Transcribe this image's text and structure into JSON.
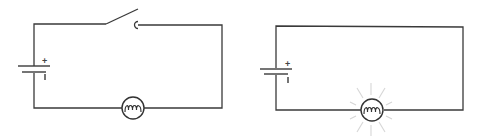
{
  "diagram": {
    "type": "circuit-comparison",
    "colors": {
      "wire": "#3a3a3a",
      "glow": "#d6d6d6",
      "background": "#ffffff"
    },
    "circuits": [
      {
        "name": "open-circuit",
        "switch_state": "open",
        "bulb_state": "off",
        "battery": {
          "positive_label": "+",
          "negative_label": "ı"
        }
      },
      {
        "name": "closed-circuit",
        "switch_state": "none",
        "bulb_state": "lit",
        "battery": {
          "positive_label": "+",
          "negative_label": "ı"
        }
      }
    ]
  }
}
